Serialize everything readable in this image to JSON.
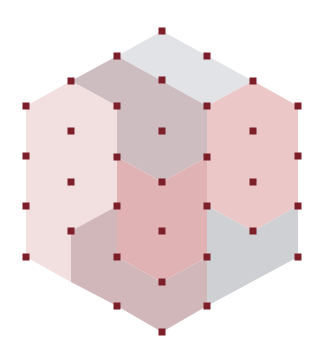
{
  "diagram": {
    "width": 320,
    "height": 361,
    "background": "#ffffff",
    "dot": {
      "size": 7,
      "color": "#7d1f28"
    },
    "regions": [
      {
        "name": "top-gray-rhombus",
        "color": "#e2e3e6",
        "points": [
          [
            117,
            56
          ],
          [
            162,
            31
          ],
          [
            253,
            81
          ],
          [
            207,
            106
          ]
        ]
      },
      {
        "name": "taupe-upper-hex",
        "color": "#cdbdc0",
        "points": [
          [
            71,
            81
          ],
          [
            117,
            56
          ],
          [
            207,
            106
          ],
          [
            207,
            157
          ],
          [
            162,
            182
          ],
          [
            117,
            157
          ],
          [
            117,
            106
          ]
        ]
      },
      {
        "name": "left-pale-pink-hex",
        "color": "#f2dfe0",
        "points": [
          [
            26,
            106
          ],
          [
            71,
            81
          ],
          [
            117,
            106
          ],
          [
            117,
            206
          ],
          [
            71,
            231
          ],
          [
            71,
            282
          ],
          [
            26,
            257
          ]
        ]
      },
      {
        "name": "right-pink-hex",
        "color": "#ebc7c8",
        "points": [
          [
            207,
            106
          ],
          [
            253,
            81
          ],
          [
            298,
            106
          ],
          [
            298,
            206
          ],
          [
            253,
            231
          ],
          [
            207,
            206
          ]
        ]
      },
      {
        "name": "center-pink-hex",
        "color": "#e1b2b4",
        "points": [
          [
            117,
            157
          ],
          [
            162,
            182
          ],
          [
            207,
            157
          ],
          [
            207,
            257
          ],
          [
            162,
            282
          ],
          [
            117,
            257
          ]
        ]
      },
      {
        "name": "bottom-taupe-hex",
        "color": "#d2b7ba",
        "points": [
          [
            71,
            231
          ],
          [
            117,
            206
          ],
          [
            117,
            257
          ],
          [
            162,
            282
          ],
          [
            207,
            257
          ],
          [
            207,
            306
          ],
          [
            162,
            332
          ],
          [
            117,
            306
          ],
          [
            71,
            282
          ]
        ]
      },
      {
        "name": "right-gray-region",
        "color": "#cfd0d3",
        "points": [
          [
            207,
            206
          ],
          [
            253,
            231
          ],
          [
            298,
            206
          ],
          [
            298,
            257
          ],
          [
            207,
            306
          ]
        ]
      }
    ],
    "dots": [
      [
        162,
        31
      ],
      [
        117,
        56
      ],
      [
        207,
        56
      ],
      [
        71,
        81
      ],
      [
        162,
        80
      ],
      [
        253,
        81
      ],
      [
        26,
        106
      ],
      [
        117,
        106
      ],
      [
        207,
        106
      ],
      [
        298,
        106
      ],
      [
        71,
        131
      ],
      [
        162,
        131
      ],
      [
        253,
        131
      ],
      [
        26,
        156
      ],
      [
        117,
        157
      ],
      [
        207,
        157
      ],
      [
        298,
        156
      ],
      [
        71,
        182
      ],
      [
        162,
        182
      ],
      [
        253,
        182
      ],
      [
        26,
        206
      ],
      [
        117,
        206
      ],
      [
        207,
        206
      ],
      [
        298,
        206
      ],
      [
        71,
        231
      ],
      [
        162,
        231
      ],
      [
        253,
        231
      ],
      [
        26,
        257
      ],
      [
        117,
        257
      ],
      [
        207,
        257
      ],
      [
        298,
        257
      ],
      [
        162,
        282
      ],
      [
        117,
        306
      ],
      [
        207,
        306
      ],
      [
        162,
        332
      ]
    ]
  }
}
